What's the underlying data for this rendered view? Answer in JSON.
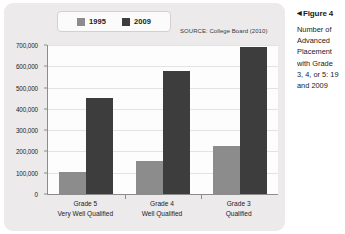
{
  "chart_data": {
    "type": "bar",
    "title": "",
    "source": "SOURCE: College Board (2010)",
    "categories": [
      "Grade 5 Very Well Qualified",
      "Grade 4 Well Qualified",
      "Grade 3 Qualified"
    ],
    "category_lines": [
      {
        "line1": "Grade 5",
        "line2": "Very Well Qualified"
      },
      {
        "line1": "Grade 4",
        "line2": "Well Qualified"
      },
      {
        "line1": "Grade 3",
        "line2": "Qualified"
      }
    ],
    "series": [
      {
        "name": "1995",
        "color": "#8c8c8c",
        "values": [
          105000,
          155000,
          225000
        ]
      },
      {
        "name": "2009",
        "color": "#3d3d3d",
        "values": [
          450000,
          580000,
          690000
        ]
      }
    ],
    "ylabel": "",
    "xlabel": "",
    "ylim": [
      0,
      700000
    ],
    "ytick_labels": [
      "0",
      "100,000",
      "200,000",
      "300,000",
      "400,000",
      "500,000",
      "600,000",
      "700,000"
    ],
    "ytick_values": [
      0,
      100000,
      200000,
      300000,
      400000,
      500000,
      600000,
      700000
    ],
    "grid": true,
    "legend_position": "top"
  },
  "legend": {
    "entries": [
      {
        "label": "1995",
        "color": "#8c8c8c"
      },
      {
        "label": "2009",
        "color": "#3d3d3d"
      }
    ]
  },
  "caption": {
    "arrow": "◀",
    "heading": "Figure 4",
    "lines": [
      "Number of",
      "Advanced",
      "Placement",
      "with Grade",
      "3, 4, or 5: 19",
      "and 2009"
    ]
  },
  "colors": {
    "panel_background": "#eceaea",
    "plot_background": "#fdfdfd",
    "axis": "#8d8b8b",
    "gridline": "#e4e2e2",
    "series_1995": "#8c8c8c",
    "series_2009": "#3d3d3d"
  }
}
